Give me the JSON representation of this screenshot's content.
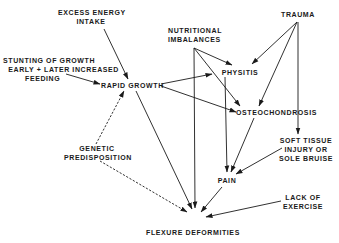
{
  "diagram": {
    "nodes": {
      "excess_energy": {
        "line1": "EXCESS ENERGY",
        "line2": "INTAKE"
      },
      "stunting": {
        "line1": "STUNTING OF GROWTH",
        "line2": "EARLY + LATER INCREASED",
        "line3": "FEEDING"
      },
      "rapid_growth": {
        "label": "RAPID GROWTH"
      },
      "nutritional": {
        "line1": "NUTRITIONAL",
        "line2": "IMBALANCES"
      },
      "trauma": {
        "label": "TRAUMA"
      },
      "physitis": {
        "label": "PHYSITIS"
      },
      "osteochondrosis": {
        "label": "OSTEOCHONDROSIS"
      },
      "soft_tissue": {
        "line1": "SOFT TISSUE",
        "line2": "INJURY OR",
        "line3": "SOLE BRUISE"
      },
      "pain": {
        "label": "PAIN"
      },
      "genetic": {
        "line1": "GENETIC",
        "line2": "PREDISPOSITION"
      },
      "lack_exercise": {
        "line1": "LACK OF",
        "line2": "EXERCISE"
      },
      "flexure": {
        "label": "FLEXURE DEFORMITIES"
      }
    },
    "edges": [
      {
        "from": "EXCESS ENERGY INTAKE",
        "to": "RAPID GROWTH",
        "style": "solid"
      },
      {
        "from": "EXCESS ENERGY INTAKE",
        "to": "FLEXURE DEFORMITIES",
        "style": "solid"
      },
      {
        "from": "STUNTING OF GROWTH EARLY + LATER INCREASED FEEDING",
        "to": "RAPID GROWTH",
        "style": "solid"
      },
      {
        "from": "RAPID GROWTH",
        "to": "PHYSITIS",
        "style": "solid"
      },
      {
        "from": "RAPID GROWTH",
        "to": "OSTEOCHONDROSIS",
        "style": "solid"
      },
      {
        "from": "NUTRITIONAL IMBALANCES",
        "to": "PHYSITIS",
        "style": "solid"
      },
      {
        "from": "NUTRITIONAL IMBALANCES",
        "to": "OSTEOCHONDROSIS",
        "style": "solid"
      },
      {
        "from": "NUTRITIONAL IMBALANCES",
        "to": "FLEXURE DEFORMITIES",
        "style": "solid"
      },
      {
        "from": "TRAUMA",
        "to": "PHYSITIS",
        "style": "solid"
      },
      {
        "from": "TRAUMA",
        "to": "OSTEOCHONDROSIS",
        "style": "solid"
      },
      {
        "from": "TRAUMA",
        "to": "SOFT TISSUE INJURY OR SOLE BRUISE",
        "style": "solid"
      },
      {
        "from": "PHYSITIS",
        "to": "PAIN",
        "style": "solid"
      },
      {
        "from": "OSTEOCHONDROSIS",
        "to": "PAIN",
        "style": "solid"
      },
      {
        "from": "SOFT TISSUE INJURY OR SOLE BRUISE",
        "to": "PAIN",
        "style": "solid"
      },
      {
        "from": "PAIN",
        "to": "FLEXURE DEFORMITIES",
        "style": "solid"
      },
      {
        "from": "GENETIC PREDISPOSITION",
        "to": "RAPID GROWTH",
        "style": "dashed"
      },
      {
        "from": "GENETIC PREDISPOSITION",
        "to": "FLEXURE DEFORMITIES",
        "style": "dashed"
      },
      {
        "from": "LACK OF EXERCISE",
        "to": "FLEXURE DEFORMITIES",
        "style": "solid"
      }
    ]
  }
}
